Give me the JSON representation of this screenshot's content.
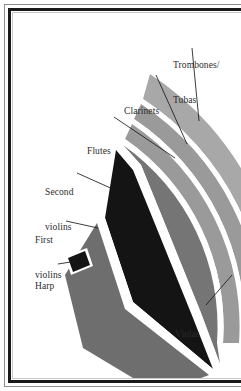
{
  "figure": {
    "kind": "orchestra-seating-plan",
    "frame": {
      "outer_rule_color": "#8d8d8d",
      "inner_rule_color": "#1a1a1a",
      "hairline_color": "#c9c9c9",
      "background": "#ffffff"
    }
  },
  "palette": {
    "dark_section": "#141414",
    "mid_section": "#6e6e6e",
    "mid_section_alt": "#757575",
    "light_section": "#9a9a9a",
    "lighter_section": "#a8a8a8",
    "separator": "#ffffff",
    "leader_line": "#1a1a1a",
    "label_text": "#2b2b2b"
  },
  "labels": [
    {
      "id": "trombones-tubas",
      "line1": "Trombones/",
      "line2": "Tubas",
      "x": 160,
      "y": 24
    },
    {
      "id": "clarinets",
      "line1": "Clarinets",
      "line2": "",
      "x": 111,
      "y": 70
    },
    {
      "id": "flutes",
      "line1": "Flutes",
      "line2": "",
      "x": 74,
      "y": 110
    },
    {
      "id": "second-violins",
      "line1": "Second",
      "line2": "violins",
      "x": 32,
      "y": 151
    },
    {
      "id": "first-violins",
      "line1": "First",
      "line2": "violins",
      "x": 22,
      "y": 199
    },
    {
      "id": "harp",
      "line1": "Harp",
      "line2": "",
      "x": 22,
      "y": 249
    },
    {
      "id": "violas",
      "line1": "Violas",
      "line2": "",
      "x": 162,
      "y": 293
    }
  ],
  "sections": [
    {
      "id": "first-violins",
      "name": "First violins",
      "color": "#6e6e6e"
    },
    {
      "id": "second-violins",
      "name": "Second violins",
      "color": "#141414"
    },
    {
      "id": "violas",
      "name": "Violas",
      "color": "#757575"
    },
    {
      "id": "harp",
      "name": "Harp",
      "color": "#141414"
    },
    {
      "id": "flutes",
      "name": "Flutes",
      "color": "#9a9a9a"
    },
    {
      "id": "clarinets",
      "name": "Clarinets",
      "color": "#9a9a9a"
    },
    {
      "id": "trombones-tubas",
      "name": "Trombones/Tubas",
      "color": "#a8a8a8"
    }
  ]
}
